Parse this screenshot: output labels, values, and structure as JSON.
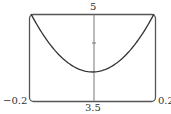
{
  "chart_data": {
    "type": "line",
    "title": "",
    "xlabel": "",
    "ylabel": "",
    "xlim": [
      -0.2,
      0.2
    ],
    "ylim": [
      3.5,
      5
    ],
    "grid": false,
    "legend": null,
    "tick_labels": {
      "x_min": "−0.2",
      "x_max": "0.2",
      "y_min": "3.5",
      "y_max": "5"
    },
    "y_ticks": [
      4.5
    ],
    "series": [
      {
        "name": "curve",
        "x": [
          -0.2,
          -0.15,
          -0.1,
          -0.05,
          0,
          0.05,
          0.1,
          0.15,
          0.2
        ],
        "y": [
          5.0,
          4.5625,
          4.25,
          4.0625,
          4.0,
          4.0625,
          4.25,
          4.5625,
          5.0
        ]
      }
    ],
    "colors": {
      "frame": "#555555",
      "curve": "#333333",
      "axis": "#777777"
    }
  }
}
